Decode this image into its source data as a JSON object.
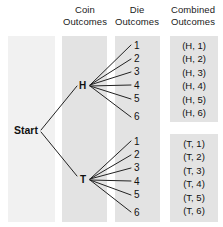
{
  "diagram": {
    "type": "tree-diagram",
    "headers": [
      {
        "line1": "Coin",
        "line2": "Outcomes"
      },
      {
        "line1": "Die",
        "line2": "Outcomes"
      },
      {
        "line1": "Combined",
        "line2": "Outcomes"
      }
    ],
    "root": {
      "label": "Start"
    },
    "branches": [
      {
        "coin": "H",
        "die_outcomes": [
          "1",
          "2",
          "3",
          "4",
          "5",
          "6"
        ],
        "combined_outcomes": [
          "(H, 1)",
          "(H, 2)",
          "(H, 3)",
          "(H, 4)",
          "(H, 5)",
          "(H, 6)"
        ]
      },
      {
        "coin": "T",
        "die_outcomes": [
          "1",
          "2",
          "3",
          "4",
          "5",
          "6"
        ],
        "combined_outcomes": [
          "(T, 1)",
          "(T, 2)",
          "(T, 3)",
          "(T, 4)",
          "(T, 5)",
          "(T, 6)"
        ]
      }
    ],
    "colors": {
      "band_fill": "#e3e3e3",
      "band_fill_pale": "#f1f1f1",
      "line": "#222222",
      "text": "#111111",
      "background": "#ffffff"
    }
  }
}
